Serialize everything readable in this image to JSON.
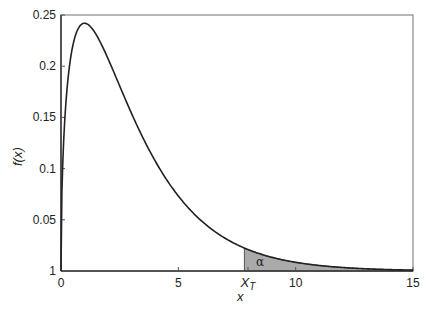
{
  "chart_data": {
    "type": "line",
    "title": "",
    "xlabel": "x",
    "ylabel": "f(x)",
    "xlim": [
      0,
      15
    ],
    "ylim": [
      0,
      0.25
    ],
    "x_ticks": [
      {
        "value": 0,
        "label": "0"
      },
      {
        "value": 5,
        "label": "5"
      },
      {
        "value": 7.815,
        "label": "X_T"
      },
      {
        "value": 10,
        "label": "10"
      },
      {
        "value": 15,
        "label": "15"
      }
    ],
    "y_ticks": [
      {
        "value": 0,
        "label": "1"
      },
      {
        "value": 0.05,
        "label": "0.05"
      },
      {
        "value": 0.1,
        "label": "0.1"
      },
      {
        "value": 0.15,
        "label": "0.15"
      },
      {
        "value": 0.2,
        "label": "0.2"
      },
      {
        "value": 0.25,
        "label": "0.25"
      }
    ],
    "series": [
      {
        "name": "f(x)",
        "degrees_of_freedom": 3,
        "x": [
          0,
          0.25,
          0.5,
          1,
          1.5,
          2,
          3,
          4,
          5,
          6,
          7,
          7.815,
          9,
          10,
          12,
          15
        ],
        "values": [
          0,
          0.176,
          0.22,
          0.242,
          0.231,
          0.208,
          0.154,
          0.108,
          0.074,
          0.048,
          0.032,
          0.022,
          0.013,
          0.008,
          0.003,
          0.0009
        ]
      }
    ],
    "shaded_region": {
      "from": 7.815,
      "to": 15,
      "label": "α",
      "color": "#aaaaaa"
    },
    "annotations": [
      {
        "text": "α",
        "x": 8.3,
        "y": 0.008
      }
    ],
    "grid": false,
    "legend": null
  },
  "labels": {
    "xlabel_main": "x",
    "ylabel_f": "f",
    "ylabel_paren": "(x)",
    "xt_main": "X",
    "xt_sub": "T",
    "alpha": "α"
  },
  "colors": {
    "curve": "#222222",
    "fill": "#aaaaaa",
    "frame": "#666666"
  }
}
